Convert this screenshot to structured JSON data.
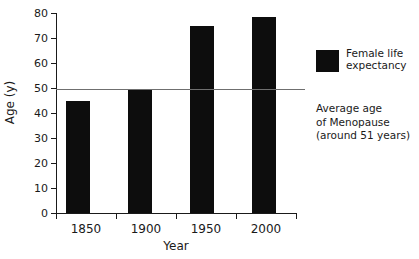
{
  "chart_data": {
    "type": "bar",
    "title": "",
    "subtitle": "",
    "categories": [
      "1850",
      "1900",
      "1950",
      "2000"
    ],
    "values": [
      45,
      50,
      75,
      79
    ],
    "series": [
      {
        "name": "Female life expectancy",
        "values": [
          45,
          50,
          75,
          79
        ]
      }
    ],
    "xlabel": "Year",
    "ylabel": "Age (y)",
    "ylim": [
      0,
      80
    ],
    "yticks": [
      0,
      10,
      20,
      30,
      40,
      50,
      60,
      70,
      80
    ],
    "ytick_labels": [
      "0",
      "10",
      "20",
      "30",
      "40",
      "50",
      "60",
      "70",
      "80"
    ],
    "grid": false,
    "legend_position": "right",
    "bar_color": "#0d0d0d",
    "reference_line": {
      "value": 50,
      "label": "Average age of Menopause (around 51 years)",
      "color": "#6f6f6f"
    },
    "annotations": [
      "Average age",
      "of Menopause",
      "(around 51 years)"
    ]
  },
  "legend": {
    "swatch_color": "#0d0d0d",
    "entries": [
      {
        "label_line1": "Female life",
        "label_line2": "expectancy"
      }
    ],
    "note": {
      "line1": "Average age",
      "line2": "of Menopause",
      "line3": "(around 51 years)"
    }
  },
  "axes": {
    "x_title": "Year",
    "y_title": "Age (y)"
  }
}
